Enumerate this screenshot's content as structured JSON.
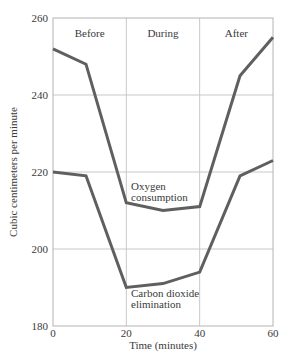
{
  "chart_data": {
    "type": "line",
    "title": "",
    "xlabel": "Time (minutes)",
    "ylabel": "Cubic centimeters per minute",
    "xlim": [
      0,
      60
    ],
    "ylim": [
      180,
      260
    ],
    "x_ticks": [
      0,
      20,
      40,
      60
    ],
    "y_ticks": [
      180,
      200,
      220,
      240,
      260
    ],
    "grid": true,
    "phases": [
      {
        "label": "Before",
        "x_range": [
          0,
          20
        ]
      },
      {
        "label": "During",
        "x_range": [
          20,
          40
        ]
      },
      {
        "label": "After",
        "x_range": [
          40,
          60
        ]
      }
    ],
    "series": [
      {
        "name": "Oxygen consumption",
        "label_lines": [
          "Oxygen",
          "consumption"
        ],
        "x": [
          0,
          9,
          20,
          30,
          40,
          51,
          60
        ],
        "values": [
          252,
          248,
          212,
          210,
          211,
          245,
          255
        ]
      },
      {
        "name": "Carbon dioxide elimination",
        "label_lines": [
          "Carbon dioxide",
          "elimination"
        ],
        "x": [
          0,
          9,
          20,
          30,
          40,
          51,
          60
        ],
        "values": [
          220,
          219,
          190,
          191,
          194,
          219,
          223
        ]
      }
    ],
    "line_color": "#5f5f5f",
    "grid_color": "#c8c8c8"
  }
}
